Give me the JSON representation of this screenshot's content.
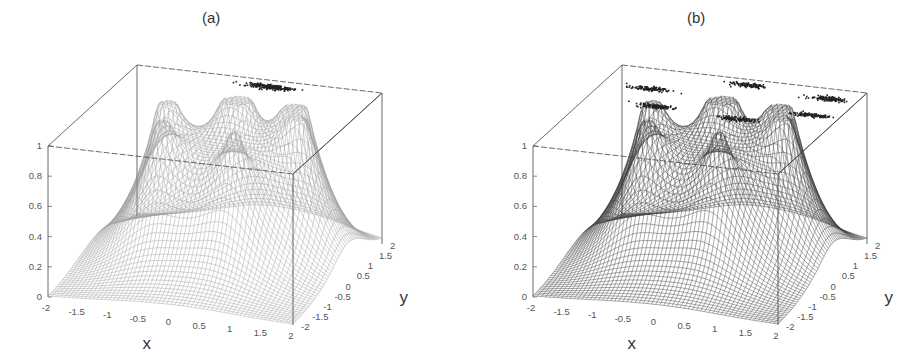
{
  "figure": {
    "panels": [
      {
        "label": "(a)",
        "title_x": 212
      },
      {
        "label": "(b)",
        "title_x": 697
      }
    ]
  },
  "chart_data": [
    {
      "type": "surface3d",
      "title": "(a)",
      "xlabel": "x",
      "ylabel": "y",
      "zlabel": "",
      "xlim": [
        -2,
        2
      ],
      "ylim": [
        -2,
        2
      ],
      "zlim": [
        0,
        1
      ],
      "x_ticks": [
        "-2",
        "-1.5",
        "-1",
        "-0.5",
        "0",
        "0.5",
        "1",
        "1.5",
        "2"
      ],
      "y_ticks": [
        "-2",
        "-1.5",
        "-1",
        "-0.5",
        "0",
        "0.5",
        "1",
        "1.5",
        "2"
      ],
      "z_ticks": [
        "0",
        "0.2",
        "0.4",
        "0.6",
        "0.8",
        "1"
      ],
      "surface_peaks": [
        {
          "x": -1.0,
          "y": 0.5,
          "z": 0.92
        },
        {
          "x": 0.0,
          "y": 1.0,
          "z": 0.98
        },
        {
          "x": -0.75,
          "y": -0.4,
          "z": 0.82
        },
        {
          "x": 0.5,
          "y": -0.5,
          "z": 0.75
        },
        {
          "x": 1.0,
          "y": 1.0,
          "z": 0.93
        },
        {
          "x": 1.25,
          "y": 0.4,
          "z": 0.85
        }
      ],
      "scatter_clusters": [
        {
          "x": 0.3,
          "y": 1.7,
          "z": 1.0,
          "spread": 0.25,
          "points": 220
        }
      ],
      "shade": "#8a8a8a"
    },
    {
      "type": "surface3d",
      "title": "(b)",
      "xlabel": "x",
      "ylabel": "y",
      "zlabel": "",
      "xlim": [
        -2,
        2
      ],
      "ylim": [
        -2,
        2
      ],
      "zlim": [
        0,
        1
      ],
      "x_ticks": [
        "-2",
        "-1.5",
        "-1",
        "-0.5",
        "0",
        "0.5",
        "1",
        "1.5",
        "2"
      ],
      "y_ticks": [
        "-2",
        "-1.5",
        "-1",
        "-0.5",
        "0",
        "0.5",
        "1",
        "1.5",
        "2"
      ],
      "z_ticks": [
        "0",
        "0.2",
        "0.4",
        "0.6",
        "0.8",
        "1"
      ],
      "surface_peaks": [
        {
          "x": -1.0,
          "y": 0.5,
          "z": 0.92
        },
        {
          "x": 0.0,
          "y": 1.0,
          "z": 0.98
        },
        {
          "x": -0.75,
          "y": -0.4,
          "z": 0.82
        },
        {
          "x": 0.5,
          "y": -0.5,
          "z": 0.75
        },
        {
          "x": 1.0,
          "y": 1.0,
          "z": 0.93
        },
        {
          "x": 1.25,
          "y": 0.4,
          "z": 0.85
        }
      ],
      "scatter_clusters": [
        {
          "x": 0.2,
          "y": 1.75,
          "z": 1.0,
          "spread": 0.22,
          "points": 110
        },
        {
          "x": 1.55,
          "y": 1.55,
          "z": 1.0,
          "spread": 0.22,
          "points": 110
        },
        {
          "x": -1.25,
          "y": 1.1,
          "z": 1.0,
          "spread": 0.22,
          "points": 110
        },
        {
          "x": 1.55,
          "y": 0.75,
          "z": 1.0,
          "spread": 0.22,
          "points": 110
        },
        {
          "x": -0.85,
          "y": 0.35,
          "z": 1.0,
          "spread": 0.22,
          "points": 110
        },
        {
          "x": 0.55,
          "y": 0.2,
          "z": 1.0,
          "spread": 0.22,
          "points": 110
        }
      ],
      "shade": "#2e2e2e"
    }
  ]
}
